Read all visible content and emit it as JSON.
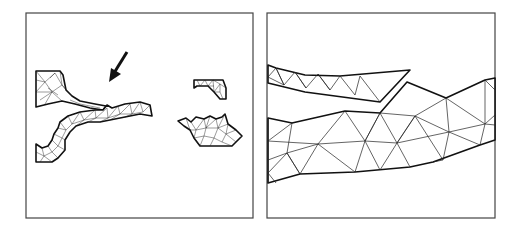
{
  "figure": {
    "panels": [
      {
        "id": "left",
        "description": "Overview of triangulated mesh regions with arrow pointing at narrow gap between two regions",
        "regions": [
          "upper-left-flange",
          "curved-band",
          "small-top-right-piece",
          "jagged-bottom-right-piece"
        ],
        "annotation": "arrow"
      },
      {
        "id": "right",
        "description": "Zoomed detail of the gap region showing coarse triangular mesh of two strips",
        "regions": [
          "upper-strip",
          "lower-band"
        ]
      }
    ],
    "colors": {
      "background": "#ffffff",
      "lines": "#111111",
      "frame": "#444444"
    }
  }
}
